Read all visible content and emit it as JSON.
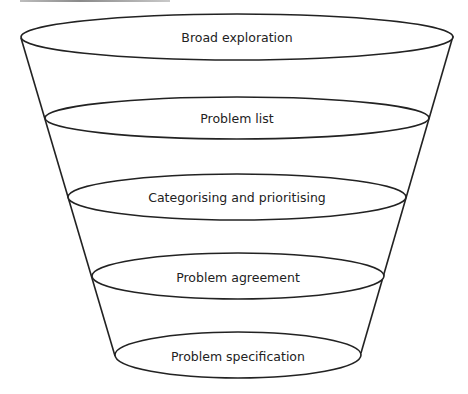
{
  "diagram": {
    "type": "funnel",
    "stages": [
      {
        "label": "Broad exploration"
      },
      {
        "label": "Problem list"
      },
      {
        "label": "Categorising and prioritising"
      },
      {
        "label": "Problem agreement"
      },
      {
        "label": "Problem specification"
      }
    ],
    "colors": {
      "stroke": "#222222",
      "fill": "#ffffff",
      "text": "#222222"
    }
  }
}
